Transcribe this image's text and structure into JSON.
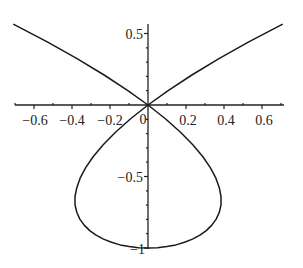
{
  "chart_data": {
    "type": "line",
    "title": "",
    "xlabel": "",
    "ylabel": "",
    "equation": "x^2 = y^2 (1 + y)",
    "parametric": {
      "x": "t(t^2-1)",
      "y": "t^2-1",
      "t_range": [
        -1.2515,
        1.2515
      ]
    },
    "xlim": [
      -0.7,
      0.7
    ],
    "ylim": [
      -1,
      0.57
    ],
    "grid": false,
    "legend": null,
    "x_ticks": [
      -0.6,
      -0.4,
      -0.2,
      0,
      0.2,
      0.4,
      0.6
    ],
    "x_tick_labels": [
      "-0.6",
      "-0.4",
      "-0.2",
      "0",
      "0.2",
      "0.4",
      "0.6"
    ],
    "y_ticks": [
      0.5,
      -0.5,
      -1
    ],
    "y_tick_labels": [
      "0.5",
      "-0.5",
      "-1"
    ],
    "series": [
      {
        "name": "curve",
        "color": "#1a1a1a",
        "x": [
          -0.709,
          -0.528,
          -0.371,
          -0.231,
          -0.108,
          0,
          0.093,
          0.171,
          0.236,
          0.288,
          0.328,
          0.357,
          0.375,
          0.384,
          0.384,
          0.375,
          0.359,
          0.336,
          0.307,
          0.273,
          0.234,
          0.192,
          0.147,
          0.099,
          0.05,
          0,
          -0.05,
          -0.099,
          -0.147,
          -0.192,
          -0.234,
          -0.273,
          -0.307,
          -0.336,
          -0.359,
          -0.375,
          -0.384,
          -0.384,
          -0.375,
          -0.357,
          -0.328,
          -0.288,
          -0.236,
          -0.171,
          -0.093,
          0,
          0.108,
          0.231,
          0.371,
          0.528,
          0.709
        ],
        "y": [
          0.566,
          0.44,
          0.323,
          0.21,
          0.103,
          0,
          -0.098,
          -0.19,
          -0.278,
          -0.36,
          -0.438,
          -0.51,
          -0.578,
          -0.64,
          -0.698,
          -0.75,
          -0.798,
          -0.84,
          -0.878,
          -0.91,
          -0.938,
          -0.96,
          -0.978,
          -0.99,
          -0.998,
          -1,
          -0.998,
          -0.99,
          -0.978,
          -0.96,
          -0.938,
          -0.91,
          -0.878,
          -0.84,
          -0.798,
          -0.75,
          -0.698,
          -0.64,
          -0.578,
          -0.51,
          -0.438,
          -0.36,
          -0.278,
          -0.19,
          -0.098,
          0,
          0.103,
          0.21,
          0.323,
          0.44,
          0.566
        ]
      }
    ]
  },
  "axes": {
    "x_labels": [
      "−0.6",
      "−0.4",
      "−0.2",
      "0",
      "0.2",
      "0.4",
      "0.6"
    ],
    "y_labels": [
      "0.5",
      "−0.5",
      "−1"
    ]
  }
}
